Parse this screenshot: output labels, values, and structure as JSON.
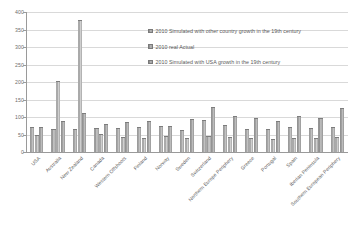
{
  "chart_data": {
    "type": "bar",
    "title": "",
    "xlabel": "",
    "ylabel": "",
    "ylim": [
      0,
      400
    ],
    "ytick_step": 50,
    "yticks": [
      0,
      50,
      100,
      150,
      200,
      250,
      300,
      350,
      400
    ],
    "grid": true,
    "legend_position": "upper-center-right inside plot",
    "categories": [
      "USA",
      "Australia",
      "New Zealand",
      "Canada",
      "Western Offshoots",
      "Finland",
      "Norway",
      "Sweden",
      "Switzerland",
      "Northern Europe Periphery",
      "Greece",
      "Portugal",
      "Spain",
      "Iberian Peninsula",
      "Southern European Periphery"
    ],
    "series": [
      {
        "name": "2010 Simulated with other country growth in the 19th century",
        "values": [
          68,
          62,
          63,
          66,
          66,
          70,
          72,
          60,
          88,
          75,
          63,
          62,
          68,
          66,
          69
        ]
      },
      {
        "name": "2010 real Actual",
        "values": [
          47,
          200,
          375,
          48,
          40,
          38,
          44,
          38,
          42,
          40,
          36,
          35,
          38,
          37,
          40
        ]
      },
      {
        "name": "2010 Simulated with USA growth in the 19th century",
        "values": [
          68,
          86,
          108,
          78,
          84,
          86,
          72,
          92,
          126,
          100,
          94,
          86,
          100,
          94,
          122
        ]
      }
    ],
    "colors": {
      "series_1": "#9b9b9b",
      "series_2": "#a5a5a5",
      "series_3": "#949494",
      "gridline": "#d9d9d9",
      "axis": "#9a9a9a",
      "tick_text": "#6e6e6e",
      "label_text": "#5d5d5d"
    }
  }
}
